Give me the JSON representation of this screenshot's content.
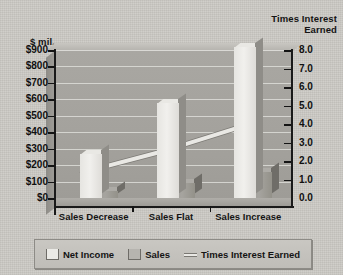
{
  "axes": {
    "left_title": "$ mil.",
    "right_title_line1": "Times Interest",
    "right_title_line2": "Earned",
    "left_ticks": [
      "$900",
      "$800",
      "$700",
      "$600",
      "$500",
      "$400",
      "$300",
      "$200",
      "$100",
      "$0"
    ],
    "right_ticks": [
      "8.0",
      "7.0",
      "6.0",
      "5.0",
      "4.0",
      "3.0",
      "2.0",
      "1.0",
      "0.0"
    ]
  },
  "legend": {
    "items": [
      {
        "label": "Net Income",
        "swatch": "net-income-swatch"
      },
      {
        "label": "Sales",
        "swatch": "sales-swatch"
      },
      {
        "label": "Times Interest Earned",
        "swatch": "line-marker-swatch"
      }
    ]
  },
  "colors": {
    "page_background": "#cdcbc6",
    "wall": "#a5a39e",
    "net_income_bar": "#ecebe7",
    "sales_bar": "#9d9b96",
    "line": "#e9e8e4",
    "axis": "#1a1a1a",
    "gridline": "#ddddd8"
  },
  "chart_data": {
    "type": "bar",
    "title": "",
    "subtitle": "",
    "categories": [
      "Sales Decrease",
      "Sales Flat",
      "Sales Increase"
    ],
    "xlabel": "",
    "ylabel": "$ mil.",
    "y2label": "Times Interest Earned",
    "ylim": [
      0,
      900
    ],
    "y2lim": [
      0,
      8
    ],
    "ytick_step": 100,
    "y2tick_step": 1,
    "grid": true,
    "legend_position": "bottom",
    "three_d": true,
    "series": [
      {
        "name": "Net Income",
        "type": "bar",
        "axis": "left",
        "values": [
          270,
          580,
          920
        ]
      },
      {
        "name": "Sales",
        "type": "bar",
        "axis": "left",
        "values": [
          40,
          90,
          160
        ]
      },
      {
        "name": "Times Interest Earned",
        "type": "line",
        "axis": "right",
        "values": [
          1.4,
          2.5,
          3.8
        ]
      }
    ]
  }
}
